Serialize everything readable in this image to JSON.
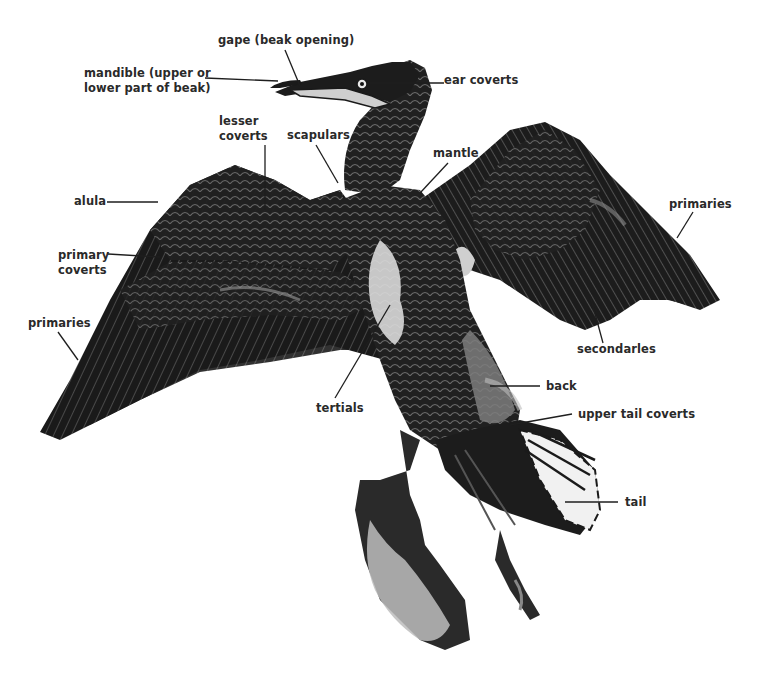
{
  "diagram": {
    "labels": {
      "gape": "gape (beak opening)",
      "mandible_line1": "mandible (upper or",
      "mandible_line2": "lower part of beak)",
      "ear_coverts": "ear coverts",
      "lesser_coverts_line1": "lesser",
      "lesser_coverts_line2": "coverts",
      "scapulars": "scapulars",
      "mantle": "mantle",
      "alula": "alula",
      "primaries_right": "primaries",
      "primary_coverts_line1": "primary",
      "primary_coverts_line2": "coverts",
      "primaries_left": "primaries",
      "secondaries": "secondarles",
      "back": "back",
      "tertials": "tertials",
      "upper_tail_coverts": "upper tail coverts",
      "tail": "tail"
    },
    "colors": {
      "plumage": "#1a1a1a",
      "plumage_mid": "#3c3c3c",
      "highlight": "#8a8a8a",
      "pale": "#d8d8d8",
      "text": "#2a2a2a",
      "leader": "#1e1e1e"
    }
  }
}
